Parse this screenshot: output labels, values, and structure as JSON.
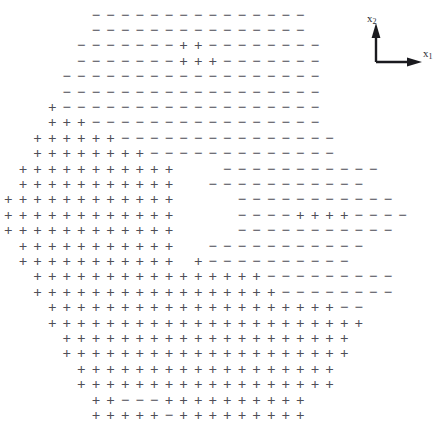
{
  "figure": {
    "title": "",
    "background_color": "#ffffff",
    "width": 445,
    "height": 400
  },
  "axes_indicator": {
    "name": "coordinate-axes-indicator",
    "origin_x": 18,
    "origin_y": 48,
    "vertical_axis_label": "x",
    "vertical_axis_subscript": "2",
    "horizontal_axis_label": "x",
    "horizontal_axis_subscript": "1",
    "arrow_color": "#1a1a1f"
  },
  "symbols": {
    "plus": "+",
    "minus": "−",
    "plus_color": "#4f4f58",
    "minus_color": "#55555e"
  },
  "chart_data": {
    "type": "scatter",
    "title": "",
    "xlabel": "x1",
    "ylabel": "x2",
    "grid": false,
    "legend": [
      {
        "symbol": "+",
        "name": "class-plus"
      },
      {
        "symbol": "−",
        "name": "class-minus"
      }
    ],
    "grid_spacing_x": 14.6,
    "grid_spacing_y": 15.4,
    "grid_origin_x": 96,
    "grid_origin_y": 15,
    "note": "Decision-region pattern: each row lists marks left-to-right starting at the given column index",
    "rows": [
      {
        "row": 0,
        "start_col": 0,
        "marks": "---------------"
      },
      {
        "row": 1,
        "start_col": 0,
        "marks": "---------------"
      },
      {
        "row": 2,
        "start_col": -1,
        "marks": "-------++--------"
      },
      {
        "row": 3,
        "start_col": -1,
        "marks": "-------+++-------"
      },
      {
        "row": 4,
        "start_col": -2,
        "marks": "------------------"
      },
      {
        "row": 5,
        "start_col": -2,
        "marks": "------------------"
      },
      {
        "row": 6,
        "start_col": -3,
        "marks": "+------------------"
      },
      {
        "row": 7,
        "start_col": -3,
        "marks": "+++----------------"
      },
      {
        "row": 8,
        "start_col": -4,
        "marks": "++++++---------------"
      },
      {
        "row": 9,
        "start_col": -4,
        "marks": "++++++++-------------"
      },
      {
        "row": 10,
        "start_col": -5,
        "marks": "+++++++++++___-----------"
      },
      {
        "row": 11,
        "start_col": -5,
        "marks": "+++++++++++__-----------"
      },
      {
        "row": 12,
        "start_col": -6,
        "marks": "++++++++++++____-----------"
      },
      {
        "row": 13,
        "start_col": -6,
        "marks": "++++++++++++____----++++----"
      },
      {
        "row": 14,
        "start_col": -6,
        "marks": "++++++++++++____-----------"
      },
      {
        "row": 15,
        "start_col": -5,
        "marks": "+++++++++++__-----------"
      },
      {
        "row": 16,
        "start_col": -5,
        "marks": "+++++++++++_+----------"
      },
      {
        "row": 17,
        "start_col": -4,
        "marks": "++++++++++++++++---------"
      },
      {
        "row": 18,
        "start_col": -4,
        "marks": "+++++++++++++++++--------"
      },
      {
        "row": 19,
        "start_col": -3,
        "marks": "++++++++++++++++++++--"
      },
      {
        "row": 20,
        "start_col": -3,
        "marks": "++++++++++++++++++++++"
      },
      {
        "row": 21,
        "start_col": -2,
        "marks": "++++++++++++++++++++"
      },
      {
        "row": 22,
        "start_col": -2,
        "marks": "++++++++++++++++++++"
      },
      {
        "row": 23,
        "start_col": -1,
        "marks": "++++++++++++++++++"
      },
      {
        "row": 24,
        "start_col": -1,
        "marks": "++++++++++++++++++"
      },
      {
        "row": 25,
        "start_col": 0,
        "marks": "++---++++++++++"
      },
      {
        "row": 26,
        "start_col": 0,
        "marks": "+++++-+++++++++"
      }
    ]
  }
}
